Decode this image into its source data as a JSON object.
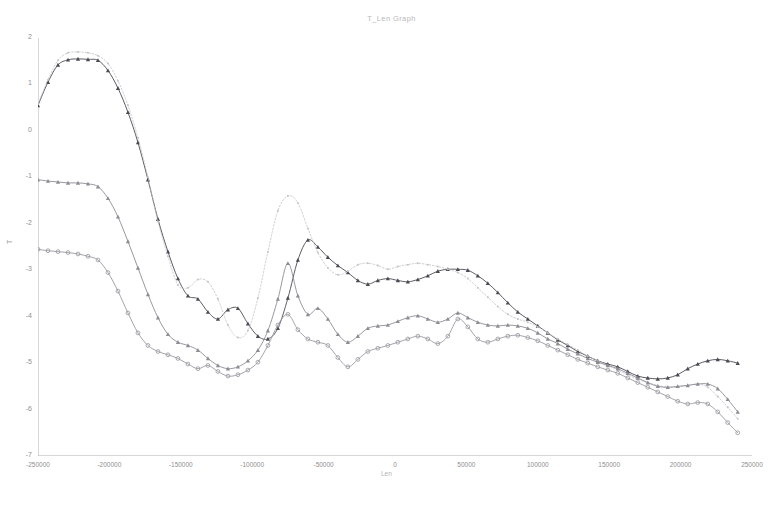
{
  "chart_data": {
    "type": "line",
    "title": "T_Len Graph",
    "xlabel": "Len",
    "ylabel": "T",
    "xlim": [
      -250000,
      250000
    ],
    "ylim": [
      -7,
      2
    ],
    "xticks": [
      -250000,
      -200000,
      -150000,
      -100000,
      -50000,
      0,
      50000,
      100000,
      150000,
      200000,
      250000
    ],
    "xtick_labels": [
      "-250000",
      "-200000",
      "-150000",
      "-100000",
      "-50000",
      "0",
      "50000",
      "100000",
      "150000",
      "200000",
      "250000"
    ],
    "yticks": [
      2,
      1,
      0,
      -1,
      -2,
      -3,
      -4,
      -5,
      -6,
      -7
    ],
    "ytick_labels": [
      "2",
      "1",
      "0",
      "-1",
      "-2",
      "-3",
      "-4",
      "-5",
      "-6",
      "-7"
    ],
    "grid": false,
    "legend": "none",
    "x": [
      -250000,
      -243000,
      -236000,
      -229000,
      -222000,
      -215000,
      -208000,
      -201000,
      -194000,
      -187000,
      -180000,
      -173000,
      -166000,
      -159000,
      -152000,
      -145000,
      -138000,
      -131000,
      -124000,
      -117000,
      -110000,
      -103000,
      -96000,
      -89000,
      -82000,
      -75000,
      -68000,
      -61000,
      -54000,
      -47000,
      -40000,
      -33000,
      -26000,
      -19000,
      -12000,
      -5000,
      2000,
      9000,
      16000,
      23000,
      30000,
      37000,
      44000,
      51000,
      58000,
      65000,
      72000,
      79000,
      86000,
      93000,
      100000,
      107000,
      114000,
      121000,
      128000,
      135000,
      142000,
      149000,
      156000,
      163000,
      170000,
      177000,
      184000,
      191000,
      198000,
      205000,
      212000,
      219000,
      226000,
      233000,
      240000
    ],
    "series": [
      {
        "name": "series-1-triangle-dark",
        "marker": "triangle",
        "color": "#4a4a52",
        "linestyle": "solid",
        "values": [
          0.55,
          1.05,
          1.42,
          1.53,
          1.55,
          1.54,
          1.52,
          1.3,
          0.92,
          0.4,
          -0.25,
          -1.05,
          -1.9,
          -2.6,
          -3.18,
          -3.55,
          -3.62,
          -3.9,
          -4.05,
          -3.85,
          -3.82,
          -4.15,
          -4.42,
          -4.48,
          -4.25,
          -3.6,
          -2.78,
          -2.35,
          -2.5,
          -2.72,
          -2.9,
          -3.05,
          -3.22,
          -3.3,
          -3.22,
          -3.18,
          -3.22,
          -3.25,
          -3.2,
          -3.12,
          -3.02,
          -2.98,
          -2.98,
          -3.0,
          -3.12,
          -3.28,
          -3.48,
          -3.7,
          -3.9,
          -4.05,
          -4.2,
          -4.35,
          -4.5,
          -4.62,
          -4.75,
          -4.85,
          -4.95,
          -5.02,
          -5.08,
          -5.18,
          -5.28,
          -5.32,
          -5.34,
          -5.32,
          -5.25,
          -5.12,
          -5.02,
          -4.95,
          -4.92,
          -4.95,
          -5.0
        ]
      },
      {
        "name": "series-2-light-dotted",
        "marker": "dot",
        "color": "#c3c3c8",
        "linestyle": "dotted",
        "values": [
          0.58,
          1.1,
          1.52,
          1.68,
          1.7,
          1.68,
          1.62,
          1.45,
          1.08,
          0.55,
          -0.15,
          -1.0,
          -1.95,
          -2.7,
          -3.32,
          -3.38,
          -3.2,
          -3.25,
          -3.62,
          -4.18,
          -4.45,
          -4.3,
          -3.6,
          -2.6,
          -1.72,
          -1.4,
          -1.55,
          -2.1,
          -2.62,
          -2.95,
          -3.1,
          -3.02,
          -2.88,
          -2.85,
          -2.9,
          -2.98,
          -2.92,
          -2.88,
          -2.85,
          -2.88,
          -2.92,
          -2.98,
          -3.05,
          -3.18,
          -3.38,
          -3.58,
          -3.78,
          -3.95,
          -4.05,
          -4.12,
          -4.22,
          -4.35,
          -4.48,
          -4.6,
          -4.72,
          -4.85,
          -4.95,
          -5.05,
          -5.15,
          -5.25,
          -5.35,
          -5.42,
          -5.48,
          -5.52,
          -5.52,
          -5.48,
          -5.45,
          -5.52,
          -5.72,
          -5.95,
          -6.2
        ]
      },
      {
        "name": "series-3-triangle-mid",
        "marker": "triangle",
        "color": "#8c8c94",
        "linestyle": "solid",
        "values": [
          -1.05,
          -1.08,
          -1.1,
          -1.12,
          -1.12,
          -1.14,
          -1.2,
          -1.45,
          -1.85,
          -2.38,
          -2.95,
          -3.52,
          -4.02,
          -4.38,
          -4.55,
          -4.62,
          -4.72,
          -4.9,
          -5.05,
          -5.12,
          -5.08,
          -4.95,
          -4.72,
          -4.3,
          -3.62,
          -2.85,
          -3.55,
          -3.95,
          -3.82,
          -4.05,
          -4.38,
          -4.55,
          -4.42,
          -4.25,
          -4.2,
          -4.18,
          -4.1,
          -4.02,
          -3.98,
          -4.05,
          -4.12,
          -4.05,
          -3.92,
          -4.02,
          -4.12,
          -4.18,
          -4.2,
          -4.18,
          -4.2,
          -4.25,
          -4.35,
          -4.48,
          -4.58,
          -4.7,
          -4.8,
          -4.9,
          -4.98,
          -5.05,
          -5.12,
          -5.22,
          -5.32,
          -5.42,
          -5.5,
          -5.52,
          -5.5,
          -5.48,
          -5.45,
          -5.45,
          -5.55,
          -5.78,
          -6.05
        ]
      },
      {
        "name": "series-4-circle",
        "marker": "circle",
        "color": "#9a9aa2",
        "linestyle": "solid",
        "values": [
          -2.55,
          -2.58,
          -2.6,
          -2.62,
          -2.65,
          -2.7,
          -2.78,
          -3.05,
          -3.45,
          -3.92,
          -4.35,
          -4.62,
          -4.75,
          -4.82,
          -4.9,
          -5.02,
          -5.12,
          -5.05,
          -5.18,
          -5.28,
          -5.25,
          -5.15,
          -4.98,
          -4.62,
          -4.18,
          -3.95,
          -4.28,
          -4.48,
          -4.55,
          -4.62,
          -4.88,
          -5.08,
          -4.92,
          -4.75,
          -4.68,
          -4.62,
          -4.55,
          -4.48,
          -4.42,
          -4.48,
          -4.58,
          -4.42,
          -4.05,
          -4.22,
          -4.48,
          -4.55,
          -4.48,
          -4.42,
          -4.4,
          -4.45,
          -4.52,
          -4.62,
          -4.72,
          -4.82,
          -4.92,
          -5.0,
          -5.08,
          -5.15,
          -5.22,
          -5.32,
          -5.42,
          -5.52,
          -5.62,
          -5.72,
          -5.82,
          -5.88,
          -5.85,
          -5.88,
          -6.05,
          -6.28,
          -6.5
        ]
      }
    ]
  }
}
